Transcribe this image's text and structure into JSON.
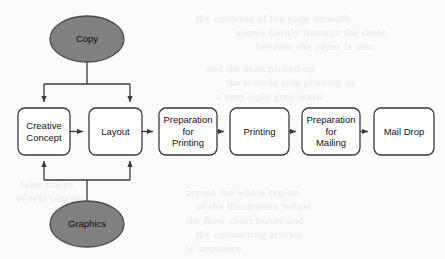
{
  "diagram": {
    "background_color": "#fbfbfa",
    "colors": {
      "ellipse_fill": "#808080",
      "ellipse_stroke": "#4a4a4a",
      "box_fill": "#ffffff",
      "box_stroke": "#3a3a3a",
      "connector": "#3a3a3a",
      "text": "#111111",
      "ghost_text": "#e9e9e7"
    },
    "inputs": [
      {
        "id": "copy",
        "label": "Copy",
        "shape": "ellipse",
        "cx": 87,
        "cy": 39,
        "rx": 37,
        "ry": 23
      },
      {
        "id": "graphics",
        "label": "Graphics",
        "shape": "ellipse",
        "cx": 87,
        "cy": 224,
        "rx": 37,
        "ry": 23
      }
    ],
    "steps": [
      {
        "id": "creative-concept",
        "label": "Creative\nConcept",
        "lines": [
          "Creative",
          "Concept"
        ],
        "x": 18,
        "y": 108,
        "w": 52,
        "h": 47
      },
      {
        "id": "layout",
        "label": "Layout",
        "lines": [
          "Layout"
        ],
        "x": 89,
        "y": 108,
        "w": 53,
        "h": 47
      },
      {
        "id": "preparation-for-printing",
        "label": "Preparation\nfor\nPrinting",
        "lines": [
          "Preparation",
          "for",
          "Printing"
        ],
        "x": 159,
        "y": 108,
        "w": 58,
        "h": 47
      },
      {
        "id": "printing",
        "label": "Printing",
        "lines": [
          "Printing"
        ],
        "x": 230,
        "y": 108,
        "w": 59,
        "h": 47
      },
      {
        "id": "preparation-for-mailing",
        "label": "Preparation\nfor\nMailing",
        "lines": [
          "Preparation",
          "for",
          "Mailing"
        ],
        "x": 302,
        "y": 108,
        "w": 58,
        "h": 47
      },
      {
        "id": "mail-drop",
        "label": "Mail Drop",
        "lines": [
          "Mail Drop"
        ],
        "x": 374,
        "y": 108,
        "w": 60,
        "h": 47
      }
    ],
    "connections": [
      {
        "from": "copy",
        "to": "creative-concept",
        "direction": "down",
        "style": "branch"
      },
      {
        "from": "copy",
        "to": "layout",
        "direction": "down",
        "style": "branch"
      },
      {
        "from": "graphics",
        "to": "creative-concept",
        "direction": "up",
        "style": "branch"
      },
      {
        "from": "graphics",
        "to": "layout",
        "direction": "up",
        "style": "branch"
      },
      {
        "from": "creative-concept",
        "to": "layout",
        "direction": "right",
        "style": "straight"
      },
      {
        "from": "layout",
        "to": "preparation-for-printing",
        "direction": "right",
        "style": "straight"
      },
      {
        "from": "preparation-for-printing",
        "to": "printing",
        "direction": "right",
        "style": "straight"
      },
      {
        "from": "printing",
        "to": "preparation-for-mailing",
        "direction": "right",
        "style": "straight"
      },
      {
        "from": "preparation-for-mailing",
        "to": "mail-drop",
        "direction": "right",
        "style": "straight"
      }
    ]
  },
  "background_ghost_text": [
    {
      "text": "the contents of the page beneath",
      "x": 196,
      "y": 12
    },
    {
      "text": "shows faintly through the sheet",
      "x": 236,
      "y": 26
    },
    {
      "text": "because the paper is thin",
      "x": 256,
      "y": 40
    },
    {
      "text": "and the scan picked up",
      "x": 206,
      "y": 62
    },
    {
      "text": "the reverse side printing as",
      "x": 226,
      "y": 76
    },
    {
      "text": "a very light grey wash",
      "x": 216,
      "y": 90
    },
    {
      "text": "across the whole region",
      "x": 186,
      "y": 186
    },
    {
      "text": "of the illustration below",
      "x": 196,
      "y": 200
    },
    {
      "text": "the flow chart boxes and",
      "x": 186,
      "y": 214
    },
    {
      "text": "the connecting arrows",
      "x": 196,
      "y": 228
    },
    {
      "text": "in sequence",
      "x": 186,
      "y": 242
    },
    {
      "text": "faint traces",
      "x": 20,
      "y": 178
    },
    {
      "text": "of text remain",
      "x": 16,
      "y": 192
    }
  ]
}
